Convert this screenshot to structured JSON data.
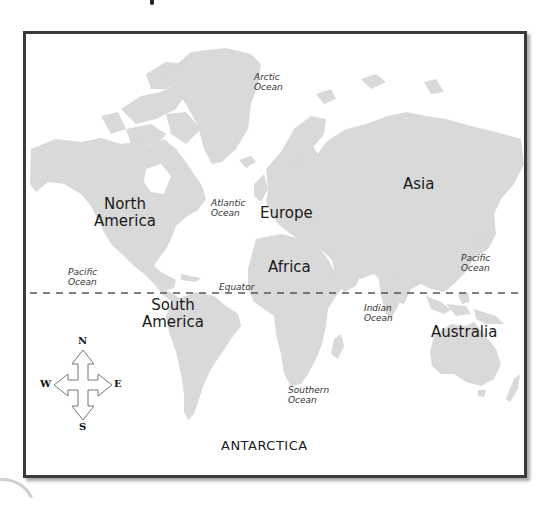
{
  "map": {
    "title": "World Map",
    "land_color": "#d9d9d9",
    "border_color": "#3a3a3a",
    "equator_label": "Equator",
    "continents": [
      {
        "name": "North",
        "name2": "America"
      },
      {
        "name": "South",
        "name2": "America"
      },
      {
        "name": "Europe"
      },
      {
        "name": "Africa"
      },
      {
        "name": "Asia"
      },
      {
        "name": "Australia"
      },
      {
        "name": "ANTARCTICA"
      }
    ],
    "oceans": [
      {
        "line1": "Arctic",
        "line2": "Ocean"
      },
      {
        "line1": "Atlantic",
        "line2": "Ocean"
      },
      {
        "line1": "Pacific",
        "line2": "Ocean"
      },
      {
        "line1": "Pacific",
        "line2": "Ocean"
      },
      {
        "line1": "Indian",
        "line2": "Ocean"
      },
      {
        "line1": "Southern",
        "line2": "Ocean"
      }
    ],
    "compass": {
      "north": "N",
      "south": "S",
      "east": "E",
      "west": "W"
    }
  }
}
